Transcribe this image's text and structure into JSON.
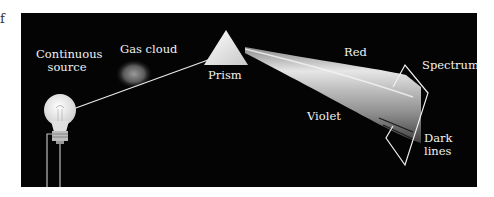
{
  "figure": {
    "corner_fragment": "f",
    "labels": {
      "continuous_source_line1": "Continuous",
      "continuous_source_line2": "source",
      "gas_cloud": "Gas cloud",
      "prism": "Prism",
      "red": "Red",
      "violet": "Violet",
      "spectrum": "Spectrum",
      "dark_lines_line1": "Dark",
      "dark_lines_line2": "lines"
    },
    "colors": {
      "background": "#040404",
      "beam_light": "#d8d8d8",
      "beam_dark": "#555555",
      "label": "#f2f2f2"
    }
  }
}
